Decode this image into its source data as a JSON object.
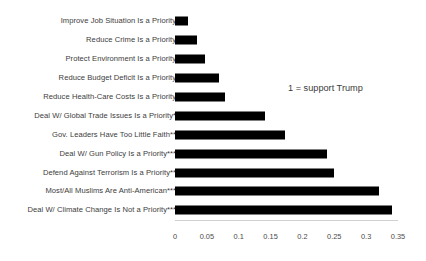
{
  "chart_data": {
    "type": "bar",
    "orientation": "horizontal",
    "title": "",
    "subtitle": "",
    "xlabel": "",
    "ylabel": "",
    "xlim": [
      0,
      0.35
    ],
    "xticks": [
      "0",
      "0.05",
      "0.1",
      "0.15",
      "0.2",
      "0.25",
      "0.3",
      "0.35"
    ],
    "xtick_values": [
      0,
      0.05,
      0.1,
      0.15,
      0.2,
      0.25,
      0.3,
      0.35
    ],
    "grid": false,
    "legend": "none",
    "bar_color": "#000000",
    "annotations": [
      "1 = support Trump"
    ],
    "categories": [
      "Improve Job Situation Is a Priority",
      "Reduce Crime Is a Priority",
      "Protect Environment Is a Priority",
      "Reduce Budget Deficit Is a Priority",
      "Reduce Health-Care Costs Is a Priority",
      "Deal W/ Global Trade Issues Is a Priority*",
      "Gov. Leaders Have Too Little Faith**",
      "Deal W/ Gun Policy Is a Priority***",
      "Defend Against Terrorism Is a Priority**",
      "Most/All Muslims Are Anti-American***",
      "Deal W/ Climate Change Is Not a Priority***"
    ],
    "values": [
      0.021,
      0.035,
      0.047,
      0.069,
      0.079,
      0.141,
      0.172,
      0.238,
      0.249,
      0.32,
      0.341
    ]
  },
  "annotation": {
    "text": "1 = support Trump"
  }
}
